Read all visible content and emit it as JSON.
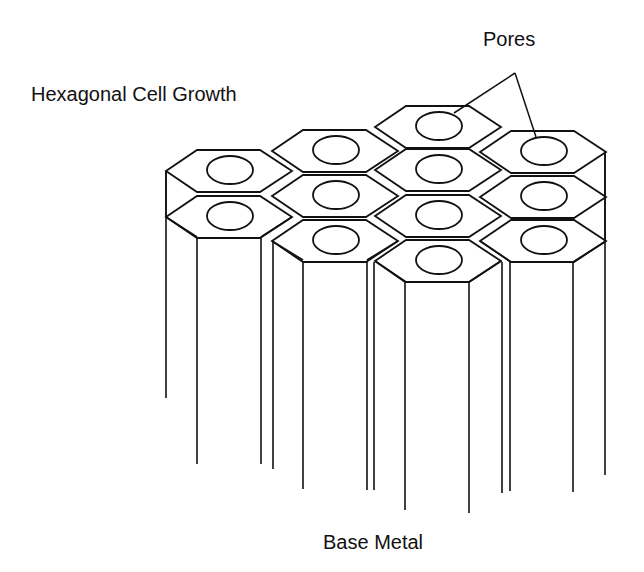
{
  "diagram": {
    "title": "Hexagonal Cell Growth",
    "labels": {
      "top_left": "Hexagonal Cell Growth",
      "pores": "Pores",
      "bottom": "Base Metal"
    },
    "structure": {
      "description": "Porous anodic oxide layer shown as hexagonal columnar cells, each with a central pore, growing from the base metal",
      "cell_columns": [
        {
          "name": "column-1",
          "visible_cells": 2
        },
        {
          "name": "column-2",
          "visible_cells": 3
        },
        {
          "name": "column-3",
          "visible_cells": 4
        },
        {
          "name": "column-4",
          "visible_cells": 3
        }
      ],
      "total_visible_cells": 12,
      "pores_pointed_to": 2
    },
    "colors": {
      "stroke": "#111111",
      "background": "#ffffff"
    }
  }
}
